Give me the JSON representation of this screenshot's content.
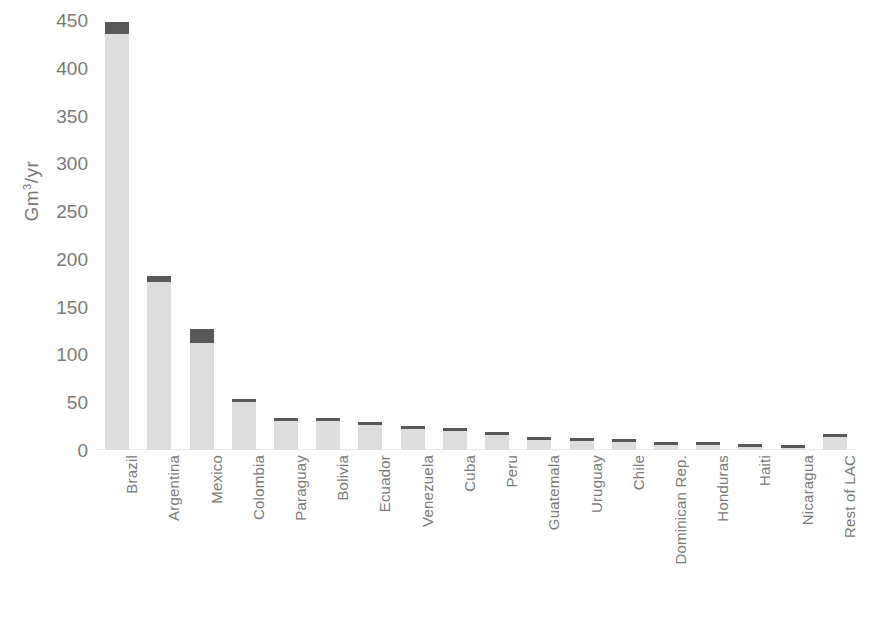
{
  "chart_data": {
    "type": "bar",
    "stacked": true,
    "title": "",
    "xlabel": "",
    "ylabel": "Gm3/yr",
    "ylabel_display": "Gm³/yr",
    "ylim": [
      0,
      450
    ],
    "ytick_step": 50,
    "ytick_labels": [
      "450",
      "400",
      "350",
      "300",
      "250",
      "200",
      "150",
      "100",
      "50",
      "0"
    ],
    "ytick_values": [
      450,
      400,
      350,
      300,
      250,
      200,
      150,
      100,
      50,
      0
    ],
    "grid": false,
    "legend_position": "bottom",
    "categories": [
      "Brazil",
      "Argentina",
      "Mexico",
      "Colombia",
      "Paraguay",
      "Bolivia",
      "Ecuador",
      "Venezuela",
      "Cuba",
      "Peru",
      "Guatemala",
      "Uruguay",
      "Chile",
      "Dominican Rep.",
      "Honduras",
      "Haiti",
      "Nicaragua",
      "Rest of LAC"
    ],
    "series": [
      {
        "name": "Green WF",
        "color": "#dddddd",
        "values": [
          435,
          176,
          112,
          50,
          30,
          30,
          26,
          22,
          20,
          16,
          11,
          9,
          8,
          5,
          5,
          3,
          2,
          14
        ]
      },
      {
        "name": "Blue WF",
        "color": "#585858",
        "values": [
          13,
          6,
          15,
          2,
          1.5,
          1.5,
          1.5,
          1.5,
          1.5,
          3,
          1.5,
          1.5,
          1.5,
          1.5,
          1.5,
          1.5,
          1.5,
          2
        ]
      }
    ],
    "totals": [
      448,
      182,
      127,
      52,
      31.5,
      31.5,
      27.5,
      23.5,
      21.5,
      19,
      12.5,
      10.5,
      9.5,
      6.5,
      6.5,
      4.5,
      3.5,
      16
    ]
  },
  "legend": {
    "items": [
      {
        "label": "Blue WF",
        "color": "#585858",
        "swatch_name": "blue-wf-swatch"
      },
      {
        "label": "Green WF",
        "color": "#dddddd",
        "swatch_name": "green-wf-swatch"
      }
    ]
  },
  "caption_partial": ""
}
